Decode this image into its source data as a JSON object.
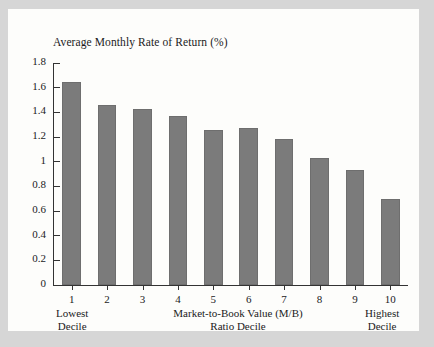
{
  "figure": {
    "background_color": "#d6d6d6",
    "panel_color": "#fdfdfb",
    "bar_color": "#7b7b7b",
    "axis_color": "#333333"
  },
  "chart_data": {
    "type": "bar",
    "title": "Average Monthly Rate of Return (%)",
    "xlabel": "Market-to-Book Value (M/B) Ratio Decile",
    "ylabel": "Average Monthly Rate of Return (%)",
    "categories": [
      "1",
      "2",
      "3",
      "4",
      "5",
      "6",
      "7",
      "8",
      "9",
      "10"
    ],
    "values": [
      1.65,
      1.46,
      1.43,
      1.37,
      1.26,
      1.27,
      1.18,
      1.03,
      0.93,
      0.7
    ],
    "ylim": [
      0,
      1.8
    ],
    "ytick_labels": [
      "0",
      "0.2",
      "0.4",
      "0.6",
      "0.8",
      "1",
      "1.2",
      "1.4",
      "1.6",
      "1.8"
    ],
    "ytick_values": [
      0,
      0.2,
      0.4,
      0.6,
      0.8,
      1.0,
      1.2,
      1.4,
      1.6,
      1.8
    ],
    "grid": false,
    "legend": null,
    "annotations": {
      "left_edge_line1": "Lowest",
      "left_edge_line2": "Decile",
      "right_edge_line1": "Highest",
      "right_edge_line2": "Decile",
      "center_line1": "Market-to-Book Value (M/B)",
      "center_line2": "Ratio Decile"
    }
  }
}
